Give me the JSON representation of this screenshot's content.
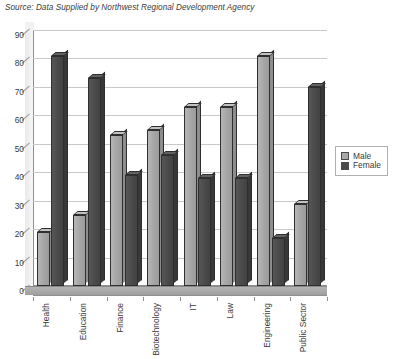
{
  "source_note": "Source: Data Supplied by Northwest Regional Development Agency",
  "legend": {
    "position": "right",
    "entries": [
      {
        "label": "Male",
        "color": "#a8a8a8",
        "swatch": "male-swatch"
      },
      {
        "label": "Female",
        "color": "#4a4a4a",
        "swatch": "female-swatch"
      }
    ]
  },
  "chart_data": {
    "type": "bar",
    "title": "",
    "subtitle": "",
    "xlabel": "",
    "ylabel": "",
    "ylim": [
      0,
      90
    ],
    "ytick_step": 10,
    "yticks": [
      0,
      10,
      20,
      30,
      40,
      50,
      60,
      70,
      80,
      90
    ],
    "grid": true,
    "grid_axis": "y",
    "legend_position": "right",
    "style": "3d-clustered-column",
    "categories": [
      "Health",
      "Education",
      "Finance",
      "Biotechnology",
      "IT",
      "Law",
      "Engineering",
      "Public Sector"
    ],
    "series": [
      {
        "name": "Male",
        "color": "#a8a8a8",
        "values": [
          19,
          25,
          53,
          55,
          63,
          63,
          81,
          29
        ]
      },
      {
        "name": "Female",
        "color": "#4a4a4a",
        "values": [
          81,
          73,
          39,
          46,
          38,
          38,
          17,
          70
        ]
      }
    ]
  }
}
